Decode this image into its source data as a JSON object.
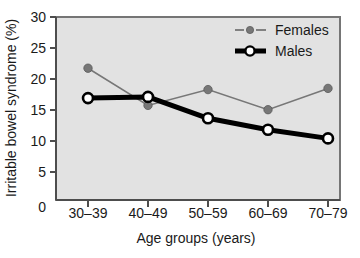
{
  "chart_data": {
    "type": "line",
    "title": "",
    "xlabel": "Age groups (years)",
    "ylabel": "Irritable bowel syndrome (%)",
    "categories": [
      "30–39",
      "40–49",
      "50–59",
      "60–69",
      "70–79"
    ],
    "x_origin_label": "0",
    "ylim": [
      0,
      30
    ],
    "yticks": [
      0,
      5,
      10,
      15,
      20,
      25,
      30
    ],
    "ytick_labels": [
      "0",
      "5",
      "10",
      "15",
      "20",
      "25",
      "30"
    ],
    "grid": false,
    "legend_position": "top-right",
    "series": [
      {
        "name": "Females",
        "values": [
          21.6,
          15.5,
          18.1,
          14.8,
          18.3
        ],
        "color": "#777777",
        "marker": "filled-circle",
        "line_style": "thin"
      },
      {
        "name": "Males",
        "values": [
          16.7,
          16.9,
          13.4,
          11.5,
          10.1
        ],
        "color": "#000000",
        "marker": "open-circle",
        "line_style": "thick"
      }
    ],
    "plot_background": "#e2e2e2",
    "frame_color": "#707070"
  },
  "legend": {
    "items": [
      {
        "label": "Females"
      },
      {
        "label": "Males"
      }
    ]
  },
  "axes": {
    "y_title": "Irritable bowel syndrome (%)",
    "x_title": "Age groups (years)"
  }
}
